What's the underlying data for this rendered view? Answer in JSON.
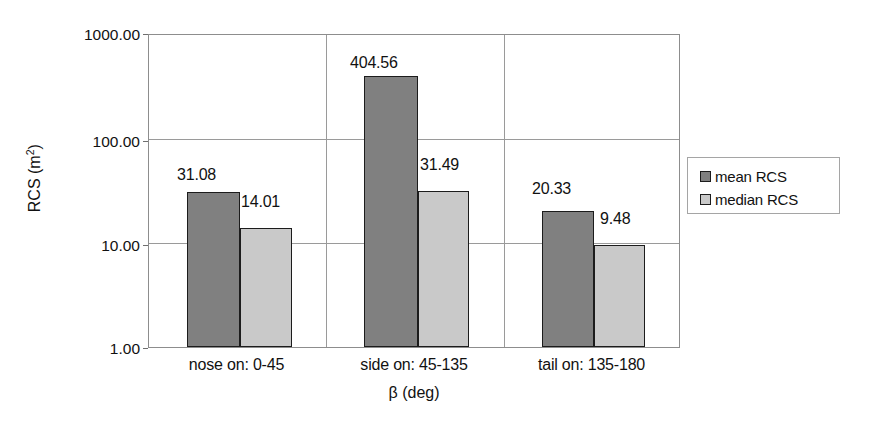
{
  "chart_data": {
    "type": "bar",
    "title": "",
    "xlabel": "β (deg)",
    "ylabel": "RCS (m²)",
    "ylabel_base": "RCS (m",
    "ylabel_sup": "2",
    "ylabel_close": ")",
    "yscale": "log",
    "ylim": [
      1,
      1000
    ],
    "ytick_labels": [
      "1000.00",
      "100.00",
      "10.00",
      "1.00"
    ],
    "ytick_values": [
      1000,
      100,
      10,
      1
    ],
    "grid": true,
    "legend_position": "right",
    "categories": [
      "nose on:  0-45",
      "side on: 45-135",
      "tail on: 135-180"
    ],
    "series": [
      {
        "name": "mean RCS",
        "color": "#808080",
        "values": [
          31.08,
          404.56,
          20.33
        ],
        "labels": [
          "31.08",
          "404.56",
          "20.33"
        ]
      },
      {
        "name": "median RCS",
        "color": "#c9c9c9",
        "values": [
          14.01,
          31.49,
          9.48
        ],
        "labels": [
          "14.01",
          "31.49",
          "9.48"
        ]
      }
    ]
  },
  "legend": {
    "items": [
      {
        "label": "mean RCS"
      },
      {
        "label": "median RCS"
      }
    ]
  }
}
